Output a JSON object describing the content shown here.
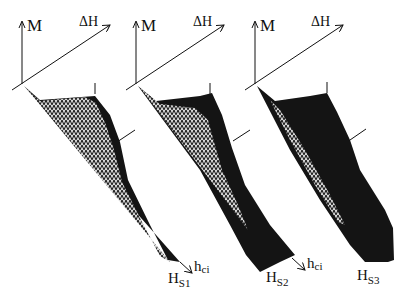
{
  "figure": {
    "colors": {
      "ink": "#111111",
      "hatch_bg": "#ffffff",
      "solid": "#141414"
    },
    "panels": [
      {
        "id": 1,
        "axis_m": "M",
        "axis_dh": "ΔH",
        "axis_hci": "h",
        "axis_hci_sub": "ci",
        "hs_label": "H",
        "hs_sub": "S1"
      },
      {
        "id": 2,
        "axis_m": "M",
        "axis_dh": "ΔH",
        "axis_hci": "h",
        "axis_hci_sub": "ci",
        "hs_label": "H",
        "hs_sub": "S2"
      },
      {
        "id": 3,
        "axis_m": "M",
        "axis_dh": "ΔH",
        "axis_hci": "h",
        "axis_hci_sub": "ci",
        "hs_label": "H",
        "hs_sub": "S3"
      }
    ]
  }
}
